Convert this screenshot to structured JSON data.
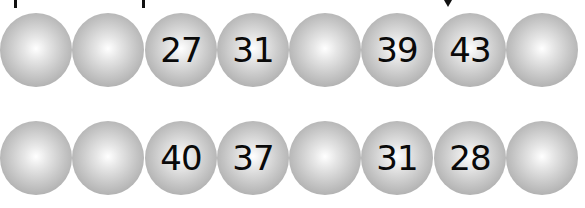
{
  "marks": [
    {
      "type": "tick",
      "x": 14
    },
    {
      "type": "tick",
      "x": 142
    },
    {
      "type": "arrow",
      "x": 446
    }
  ],
  "rows": [
    {
      "balls": [
        "",
        "",
        "27",
        "31",
        "",
        "39",
        "43",
        ""
      ]
    },
    {
      "balls": [
        "",
        "",
        "40",
        "37",
        "",
        "31",
        "28",
        ""
      ]
    }
  ],
  "colors": {
    "ball_highlight": "#ffffff",
    "ball_shadow": "#9a9a9a",
    "text": "#0a0a0a"
  }
}
